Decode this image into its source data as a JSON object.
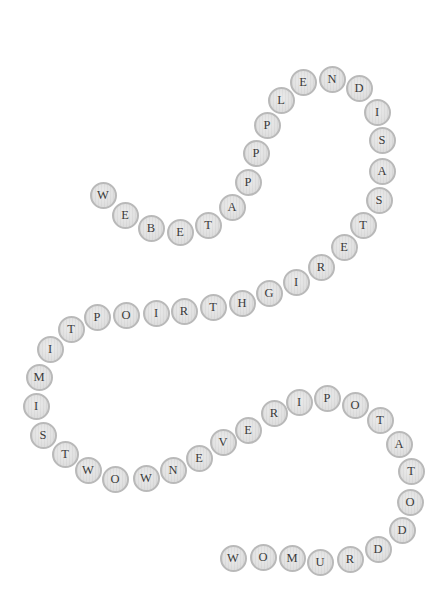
{
  "puzzle": {
    "type": "letter-bead-chain",
    "bead_fill": "#e0e0e0",
    "bead_border": "#b9b9b9",
    "letter_color": "#3a3a3a",
    "sequence": "WEBETAPPPLENDISASTERIGHTRIOPTIMISTWOWNEVERIPOTATODDRUMOW",
    "beads": [
      {
        "letter": "W",
        "x": 103,
        "y": 195
      },
      {
        "letter": "E",
        "x": 125,
        "y": 215
      },
      {
        "letter": "B",
        "x": 151,
        "y": 228
      },
      {
        "letter": "E",
        "x": 180,
        "y": 232
      },
      {
        "letter": "T",
        "x": 208,
        "y": 225
      },
      {
        "letter": "A",
        "x": 232,
        "y": 207
      },
      {
        "letter": "P",
        "x": 248,
        "y": 182
      },
      {
        "letter": "P",
        "x": 256,
        "y": 153
      },
      {
        "letter": "P",
        "x": 267,
        "y": 125
      },
      {
        "letter": "L",
        "x": 281,
        "y": 100
      },
      {
        "letter": "E",
        "x": 303,
        "y": 82
      },
      {
        "letter": "N",
        "x": 332,
        "y": 79
      },
      {
        "letter": "D",
        "x": 359,
        "y": 88
      },
      {
        "letter": "I",
        "x": 377,
        "y": 112
      },
      {
        "letter": "S",
        "x": 382,
        "y": 140
      },
      {
        "letter": "A",
        "x": 382,
        "y": 171
      },
      {
        "letter": "S",
        "x": 379,
        "y": 200
      },
      {
        "letter": "T",
        "x": 363,
        "y": 225
      },
      {
        "letter": "E",
        "x": 344,
        "y": 247
      },
      {
        "letter": "R",
        "x": 321,
        "y": 267
      },
      {
        "letter": "I",
        "x": 296,
        "y": 282
      },
      {
        "letter": "G",
        "x": 269,
        "y": 293
      },
      {
        "letter": "H",
        "x": 242,
        "y": 303
      },
      {
        "letter": "T",
        "x": 213,
        "y": 307
      },
      {
        "letter": "R",
        "x": 184,
        "y": 311
      },
      {
        "letter": "I",
        "x": 156,
        "y": 313
      },
      {
        "letter": "O",
        "x": 126,
        "y": 315
      },
      {
        "letter": "P",
        "x": 97,
        "y": 317
      },
      {
        "letter": "T",
        "x": 71,
        "y": 329
      },
      {
        "letter": "I",
        "x": 50,
        "y": 349
      },
      {
        "letter": "M",
        "x": 39,
        "y": 377
      },
      {
        "letter": "I",
        "x": 36,
        "y": 406
      },
      {
        "letter": "S",
        "x": 43,
        "y": 435
      },
      {
        "letter": "T",
        "x": 65,
        "y": 454
      },
      {
        "letter": "W",
        "x": 88,
        "y": 470
      },
      {
        "letter": "O",
        "x": 115,
        "y": 479
      },
      {
        "letter": "W",
        "x": 146,
        "y": 478
      },
      {
        "letter": "N",
        "x": 173,
        "y": 470
      },
      {
        "letter": "E",
        "x": 199,
        "y": 458
      },
      {
        "letter": "V",
        "x": 223,
        "y": 442
      },
      {
        "letter": "E",
        "x": 248,
        "y": 430
      },
      {
        "letter": "R",
        "x": 274,
        "y": 413
      },
      {
        "letter": "I",
        "x": 299,
        "y": 402
      },
      {
        "letter": "P",
        "x": 327,
        "y": 398
      },
      {
        "letter": "O",
        "x": 355,
        "y": 405
      },
      {
        "letter": "T",
        "x": 380,
        "y": 420
      },
      {
        "letter": "A",
        "x": 399,
        "y": 444
      },
      {
        "letter": "T",
        "x": 411,
        "y": 471
      },
      {
        "letter": "O",
        "x": 410,
        "y": 502
      },
      {
        "letter": "D",
        "x": 402,
        "y": 530
      },
      {
        "letter": "D",
        "x": 378,
        "y": 549
      },
      {
        "letter": "R",
        "x": 350,
        "y": 559
      },
      {
        "letter": "U",
        "x": 320,
        "y": 562
      },
      {
        "letter": "M",
        "x": 292,
        "y": 558
      },
      {
        "letter": "O",
        "x": 263,
        "y": 557
      },
      {
        "letter": "W",
        "x": 233,
        "y": 558
      }
    ]
  }
}
